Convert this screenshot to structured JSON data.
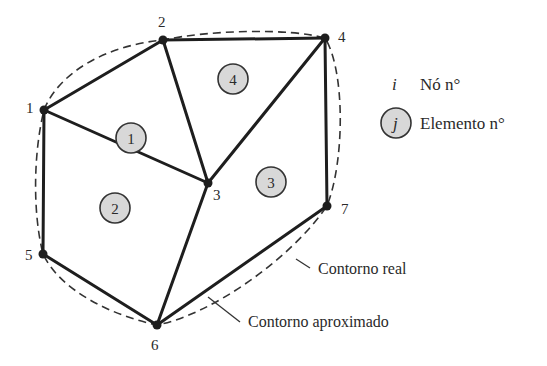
{
  "diagram": {
    "type": "finite-element-mesh",
    "colors": {
      "line": "#1e1e1e",
      "element_fill": "#d8d8d8",
      "text": "#2a2a2a",
      "background": "#ffffff"
    },
    "nodes": [
      {
        "id": "1",
        "label": "1"
      },
      {
        "id": "2",
        "label": "2"
      },
      {
        "id": "3",
        "label": "3"
      },
      {
        "id": "4",
        "label": "4"
      },
      {
        "id": "5",
        "label": "5"
      },
      {
        "id": "6",
        "label": "6"
      },
      {
        "id": "7",
        "label": "7"
      }
    ],
    "elements": [
      {
        "id": "1",
        "label": "1",
        "nodes": [
          "1",
          "2",
          "3"
        ]
      },
      {
        "id": "2",
        "label": "2",
        "nodes": [
          "1",
          "3",
          "6",
          "5"
        ]
      },
      {
        "id": "3",
        "label": "3",
        "nodes": [
          "3",
          "4",
          "7",
          "6"
        ]
      },
      {
        "id": "4",
        "label": "4",
        "nodes": [
          "2",
          "4",
          "3"
        ]
      }
    ],
    "legend": {
      "node_symbol": "i",
      "node_label": "Nó n°",
      "element_symbol": "j",
      "element_label": "Elemento n°"
    },
    "callouts": {
      "real_boundary": "Contorno real",
      "approx_boundary": "Contorno aproximado"
    }
  }
}
